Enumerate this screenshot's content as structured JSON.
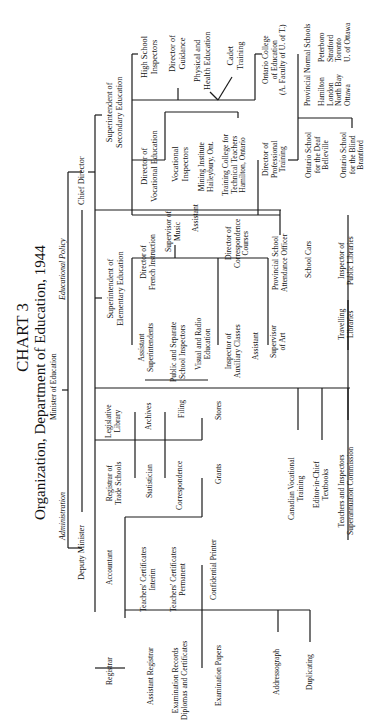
{
  "chart": {
    "title": "CHART 3",
    "subtitle": "Organization, Department of Education, 1944",
    "orientation": "rotated 90 degrees counterclockwise"
  },
  "nodes": {
    "minister": "Minister of Education",
    "administration": "Administration",
    "educational_policy": "Educational Policy",
    "deputy_minister": "Deputy Minister",
    "chief_director": "Chief Director",
    "sup_secondary": "Superintendent of\nSecondary Education",
    "high_school_inspectors": "High School\nInspectors",
    "director_guidance": "Director of\nGuidance",
    "physical_health": "Physical and\nHealth Education",
    "cadet_training": "Cadet\nTraining",
    "ontario_college": "Ontario College\nof Education\n(A. Faculty of U. of T.)",
    "provincial_normal": "Provincial Normal Schools",
    "normal_col1": "Hamilton\nLondon\nNorth Bay\nOttawa",
    "normal_col2": "Peterboro\nStratford\nToronto\nU. of Ottawa",
    "dir_vocational": "Director of\nVocational Education",
    "vocational_inspectors": "Vocational\nInspectors",
    "mining_institute": "Mining Institute\nHaileybury, Ont.",
    "training_college": "Training College for\nTechnical Teachers\nHamilton, Ontario",
    "dir_professional": "Director of\nProfessional\nTraining",
    "school_deaf": "Ontario School\nfor the Deaf\nBelleville",
    "school_blind": "Ontario School\nfor the Blind\nBrantford",
    "sup_elementary": "Superintendent of\nElementary Education",
    "dir_french": "Director of\nFrench Instruction",
    "sup_music": "Supervisor of\nMusic",
    "music_assistant": "Assistant",
    "dir_correspondence": "Director of\nCorrespondence\nCourses",
    "attendance_officer": "Provincial School\nAttendance Officer",
    "school_cars": "School Cars",
    "inspector_libraries": "Inspector of\nPublic Libraries",
    "travelling_libraries": "Travelling\nLibraries",
    "asst_superintendents": "Assistant\nSuperintendents",
    "public_separate": "Public and Separate\nSchool Inspectors",
    "visual_radio": "Visual and Radio\nEducation",
    "inspector_auxiliary": "Inspector of\nAuxiliary Classes",
    "auxiliary_assistant": "Assistant",
    "supervisor_art": "Supervisor\nof Art",
    "legislative_library": "Legislative\nLibrary",
    "archives": "Archives",
    "filing": "Filing",
    "stores": "Stores",
    "registrar_trade": "Registrar of\nTrade Schools",
    "statistician": "Statistician",
    "correspondence": "Correspondence",
    "grants": "Grants",
    "canadian_vocational": "Canadian Vocational\nTraining",
    "editor_textbooks": "Editor-in-Chief\nTextbooks",
    "superannuation": "Teachers and Inspectors\nSuperannuation Commission",
    "accountant": "Accountant",
    "certs_interim": "Teachers' Certificates\nInterim",
    "certs_permanent": "Teachers' Certificates\nPermanent",
    "confidential_printer": "Confidential Printer",
    "registrar": "Registrar",
    "asst_registrar": "Assistant Registrar",
    "exam_records": "Examination Records\nDiplomas and Certificates",
    "exam_papers": "Examination Papers",
    "addressograph": "Addressograph",
    "duplicating": "Duplicating"
  }
}
